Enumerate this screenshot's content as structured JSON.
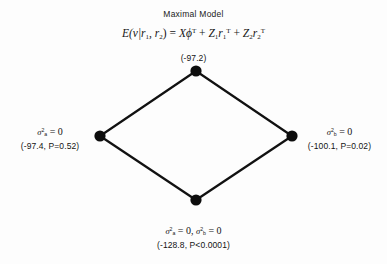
{
  "figure": {
    "title": "Maximal Model",
    "background_color": "#fdfdfd",
    "ink_color": "#111111"
  },
  "formula": {
    "lhs_E": "E",
    "lhs_args": "(v|r",
    "sub1": "1",
    "comma": ", r",
    "sub2": "2",
    "close_eq": ") = ",
    "term1_base": "X",
    "term1_phi": "ϕ",
    "term1_sup": "T",
    "plus1": " + ",
    "term2_Z": "Z",
    "term2_Zsub": "1",
    "term2_r": "r",
    "term2_rsub": "1",
    "term2_sup": "T",
    "plus2": " + ",
    "term3_Z": "Z",
    "term3_Zsub": "2",
    "term3_r": "r",
    "term3_rsub": "2",
    "term3_sup": "T",
    "plain_text": "E(v|r1, r2) = Xϕ^T + Z1r1^T + Z2r2^T"
  },
  "nodes": [
    {
      "id": "top",
      "name": "maximal-model-node",
      "constraint": "",
      "value_line": "(-97.2)",
      "aic": -97.2,
      "p_value": null,
      "cx": 196,
      "cy": 71,
      "r": 5.5
    },
    {
      "id": "left",
      "name": "sigma-a-zero-node",
      "constraint_sigma": "σ",
      "constraint_sup": "2",
      "constraint_sub": "a",
      "constraint_eq": " = 0",
      "constraint_plain": "σ²a = 0",
      "value_line": "(-97.4, P=0.52)",
      "aic": -97.4,
      "p_value": "0.52",
      "cx": 100,
      "cy": 136,
      "r": 5.5
    },
    {
      "id": "right",
      "name": "sigma-b-zero-node",
      "constraint_sigma": "σ",
      "constraint_sup": "2",
      "constraint_sub": "b",
      "constraint_eq": " = 0",
      "constraint_plain": "σ²b = 0",
      "value_line": "(-100.1, P=0.02)",
      "aic": -100.1,
      "p_value": "0.02",
      "cx": 292,
      "cy": 136,
      "r": 5.5
    },
    {
      "id": "bottom",
      "name": "both-sigma-zero-node",
      "constraint_sigma_a": "σ",
      "constraint_sup_a": "2",
      "constraint_sub_a": "a",
      "constraint_eq_a": " = 0, ",
      "constraint_sigma_b": "σ",
      "constraint_sup_b": "2",
      "constraint_sub_b": "b",
      "constraint_eq_b": " = 0",
      "constraint_plain": "σ²a = 0, σ²b = 0",
      "value_line": "(-128.8, P<0.0001)",
      "aic": -128.8,
      "p_value": "<0.0001",
      "cx": 196,
      "cy": 200,
      "r": 5.5
    }
  ],
  "edges": [
    {
      "name": "edge-top-left",
      "from": "top",
      "to": "left"
    },
    {
      "name": "edge-top-right",
      "from": "top",
      "to": "right"
    },
    {
      "name": "edge-left-bottom",
      "from": "left",
      "to": "bottom"
    },
    {
      "name": "edge-right-bottom",
      "from": "right",
      "to": "bottom"
    }
  ]
}
